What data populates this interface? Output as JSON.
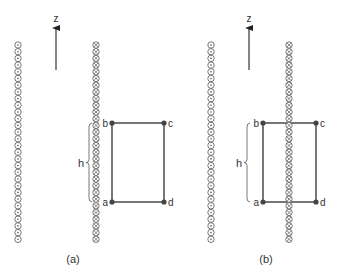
{
  "panels": [
    {
      "id": "a",
      "caption": "(a)",
      "axis_label": "z",
      "brace_label": "h",
      "corners": {
        "a": "a",
        "b": "b",
        "c": "c",
        "d": "d"
      },
      "left_column": {
        "x": 18,
        "symbol": "dot",
        "meaning": "current out of page"
      },
      "right_column": {
        "x": 96,
        "symbol": "cross",
        "meaning": "current into page"
      },
      "arrow_x": 56,
      "rect": {
        "x1": 112,
        "x2": 164,
        "y1": 123,
        "y2": 202
      },
      "brace_x": 89,
      "caption_pos": [
        73,
        263
      ]
    },
    {
      "id": "b",
      "caption": "(b)",
      "axis_label": "z",
      "brace_label": "h",
      "corners": {
        "a": "a",
        "b": "b",
        "c": "c",
        "d": "d"
      },
      "left_column": {
        "x": 211,
        "symbol": "dot",
        "meaning": "current out of page"
      },
      "right_column": {
        "x": 289,
        "symbol": "cross",
        "meaning": "current into page"
      },
      "arrow_x": 249,
      "rect": {
        "x1": 263,
        "x2": 316,
        "y1": 123,
        "y2": 202
      },
      "brace_x": 247,
      "caption_pos": [
        266,
        263
      ]
    }
  ],
  "column": {
    "y_start": 45,
    "y_end": 244,
    "radius": 3.2,
    "pitch": 6.7
  },
  "colors": {
    "line": "#555555",
    "point": "#444444",
    "text": "#333333",
    "circle": "#555555"
  }
}
